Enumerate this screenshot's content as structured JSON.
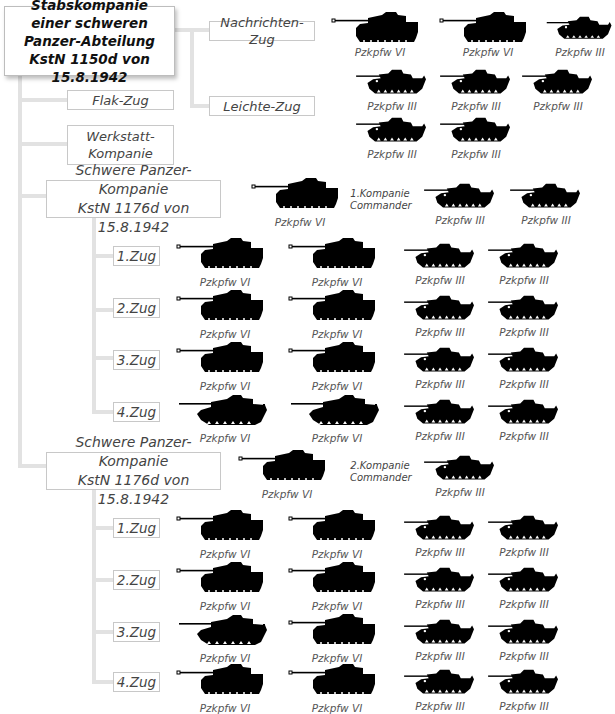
{
  "header_cut_text": "",
  "root": {
    "lines": [
      "Stabskompanie",
      "einer schweren",
      "Panzer-Abteilung",
      "KstN 1150d von 15.8.1942"
    ]
  },
  "staff_units": {
    "nachrichten": "Nachrichten-Zug",
    "leichte": "Leichte-Zug",
    "flak": "Flak-Zug",
    "werkstatt_1": "Werkstatt-",
    "werkstatt_2": "Kompanie"
  },
  "staff_tanks": {
    "nachrichten": [
      "Pzkpfw VI",
      "Pzkpfw VI",
      "Pzkpfw III"
    ],
    "leichte_row1": [
      "Pzkpfw III",
      "Pzkpfw III",
      "Pzkpfw III"
    ],
    "leichte_row2": [
      "Pzkpfw III",
      "Pzkpfw III"
    ]
  },
  "companies": [
    {
      "title_1": "Schwere Panzer-Kompanie",
      "title_2": "KstN 1176d von 15.8.1942",
      "hq_tank": "Pzkpfw VI",
      "commander_1": "1.Kompanie",
      "commander_2": "Commander",
      "hq_extra": [
        "Pzkpfw III",
        "Pzkpfw III"
      ],
      "platoons": [
        {
          "label": "1.Zug",
          "tanks": [
            "Pzkpfw VI",
            "Pzkpfw VI",
            "Pzkpfw III",
            "Pzkpfw III"
          ]
        },
        {
          "label": "2.Zug",
          "tanks": [
            "Pzkpfw VI",
            "Pzkpfw VI",
            "Pzkpfw III",
            "Pzkpfw III"
          ]
        },
        {
          "label": "3.Zug",
          "tanks": [
            "Pzkpfw VI",
            "Pzkpfw VI",
            "Pzkpfw III",
            "Pzkpfw III"
          ]
        },
        {
          "label": "4.Zug",
          "tanks": [
            "Pzkpfw VI",
            "Pzkpfw VI",
            "Pzkpfw III",
            "Pzkpfw III"
          ]
        }
      ]
    },
    {
      "title_1": "Schwere Panzer-Kompanie",
      "title_2": "KstN 1176d von 15.8.1942",
      "hq_tank": "Pzkpfw VI",
      "commander_1": "2.Kompanie",
      "commander_2": "Commander",
      "hq_extra": [
        "Pzkpfw III"
      ],
      "platoons": [
        {
          "label": "1.Zug",
          "tanks": [
            "Pzkpfw VI",
            "Pzkpfw VI",
            "Pzkpfw III",
            "Pzkpfw III"
          ]
        },
        {
          "label": "2.Zug",
          "tanks": [
            "Pzkpfw VI",
            "Pzkpfw VI",
            "Pzkpfw III",
            "Pzkpfw III"
          ]
        },
        {
          "label": "3.Zug",
          "tanks": [
            "Pzkpfw VI",
            "Pzkpfw VI",
            "Pzkpfw III",
            "Pzkpfw III"
          ]
        },
        {
          "label": "4.Zug",
          "tanks": [
            "Pzkpfw VI",
            "Pzkpfw VI",
            "Pzkpfw III",
            "Pzkpfw III"
          ]
        }
      ]
    }
  ],
  "colors": {
    "connector": "#e2e2e2",
    "box_border": "#c8c8c8",
    "silhouette": "#000000",
    "text": "#444444"
  }
}
